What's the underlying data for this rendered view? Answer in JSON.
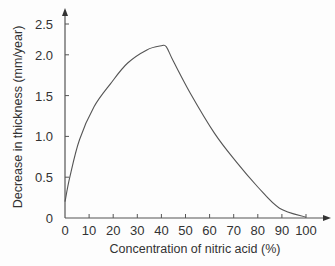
{
  "chart_data": {
    "type": "line",
    "title": "",
    "xlabel": "Concentration of nitric acid (%)",
    "ylabel": "Decrease in thickness (mm/year)",
    "xlim": [
      0,
      100
    ],
    "ylim": [
      0,
      2.5
    ],
    "grid": false,
    "legend": null,
    "x_ticks": [
      "0",
      "10",
      "20",
      "30",
      "40",
      "50",
      "60",
      "70",
      "80",
      "90",
      "100"
    ],
    "y_ticks": [
      "0",
      "0.5",
      "1.0",
      "1.5",
      "2.0",
      "2.5"
    ],
    "series": [
      {
        "name": "Decrease in thickness",
        "x": [
          0,
          2,
          6,
          12,
          19,
          26,
          34,
          40,
          42,
          45,
          52,
          62,
          71,
          80,
          89,
          100
        ],
        "y": [
          0.2,
          0.5,
          0.96,
          1.36,
          1.65,
          1.9,
          2.06,
          2.11,
          2.1,
          1.92,
          1.53,
          1.04,
          0.69,
          0.38,
          0.12,
          0.01
        ]
      }
    ]
  },
  "colors": {
    "axis": "#555555",
    "line": "#555555",
    "text": "#333333"
  }
}
